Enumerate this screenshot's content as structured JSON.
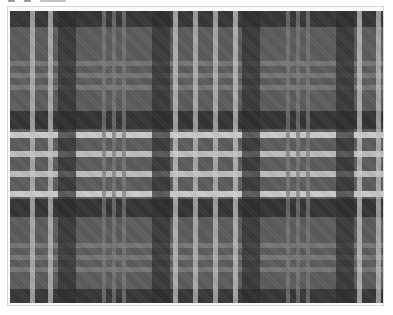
{
  "image": {
    "subject": "grayscale tartan plaid pattern",
    "icon": "plaid-pattern-image"
  },
  "toolbar": {
    "glyphs": [
      "toolbar-icon-1",
      "toolbar-icon-2",
      "toolbar-icon-3"
    ]
  },
  "pattern": {
    "colors": {
      "base": "#5a5a5a",
      "dark": "#2a2a2a",
      "darker": "#1a1a1a",
      "mid": "#6e6e6e",
      "light": "#a8a8a8",
      "white": "#e6e6e6"
    },
    "vertical_stripes": [
      {
        "x": 20,
        "w": 5,
        "color": "#c8c8c8"
      },
      {
        "x": 38,
        "w": 5,
        "color": "#c8c8c8"
      },
      {
        "x": 48,
        "w": 18,
        "color": "#2a2a2a"
      },
      {
        "x": 92,
        "w": 4,
        "color": "#7a7a7a"
      },
      {
        "x": 102,
        "w": 4,
        "color": "#7a7a7a"
      },
      {
        "x": 112,
        "w": 4,
        "color": "#7a7a7a"
      },
      {
        "x": 142,
        "w": 18,
        "color": "#2a2a2a"
      },
      {
        "x": 163,
        "w": 5,
        "color": "#d0d0d0"
      },
      {
        "x": 183,
        "w": 5,
        "color": "#c8c8c8"
      },
      {
        "x": 203,
        "w": 5,
        "color": "#c8c8c8"
      },
      {
        "x": 223,
        "w": 5,
        "color": "#d0d0d0"
      },
      {
        "x": 232,
        "w": 18,
        "color": "#2a2a2a"
      },
      {
        "x": 276,
        "w": 4,
        "color": "#7a7a7a"
      },
      {
        "x": 286,
        "w": 4,
        "color": "#7a7a7a"
      },
      {
        "x": 296,
        "w": 4,
        "color": "#7a7a7a"
      },
      {
        "x": 326,
        "w": 18,
        "color": "#2a2a2a"
      },
      {
        "x": 347,
        "w": 5,
        "color": "#d0d0d0"
      },
      {
        "x": 366,
        "w": 5,
        "color": "#c8c8c8"
      }
    ],
    "horizontal_stripes": [
      {
        "y": 0,
        "h": 16,
        "color": "#2e2e2e"
      },
      {
        "y": 50,
        "h": 5,
        "color": "#7a7a7a"
      },
      {
        "y": 62,
        "h": 5,
        "color": "#7a7a7a"
      },
      {
        "y": 74,
        "h": 5,
        "color": "#7a7a7a"
      },
      {
        "y": 100,
        "h": 18,
        "color": "#2a2a2a"
      },
      {
        "y": 121,
        "h": 6,
        "color": "#e0e0e0"
      },
      {
        "y": 140,
        "h": 6,
        "color": "#d0d0d0"
      },
      {
        "y": 160,
        "h": 6,
        "color": "#d0d0d0"
      },
      {
        "y": 180,
        "h": 6,
        "color": "#e0e0e0"
      },
      {
        "y": 188,
        "h": 18,
        "color": "#2a2a2a"
      },
      {
        "y": 232,
        "h": 5,
        "color": "#7a7a7a"
      },
      {
        "y": 244,
        "h": 5,
        "color": "#7a7a7a"
      },
      {
        "y": 256,
        "h": 5,
        "color": "#7a7a7a"
      },
      {
        "y": 278,
        "h": 14,
        "color": "#2e2e2e"
      }
    ]
  }
}
